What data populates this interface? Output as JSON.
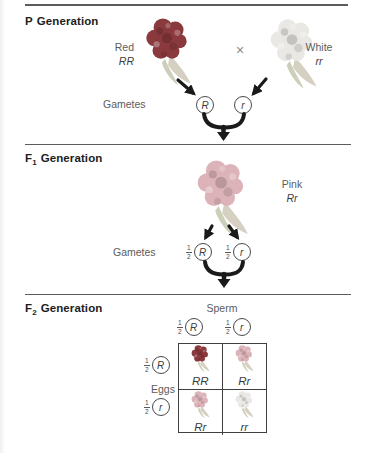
{
  "colors": {
    "red_flower": "#8a393c",
    "pink_flower": "#dcb3b9",
    "white_flower": "#eae8e4",
    "leaf": "#d6d0c2",
    "leaf2": "#cdcfba",
    "line": "#5c5c5c",
    "heading_text": "#1d1d1b",
    "label_text": "#5c5c5c",
    "genotype_text": "#3c3c3c",
    "arrow": "#1a1a1a",
    "circle_stroke": "#4a4a4a",
    "punnett_border": "#3f3f3f"
  },
  "p_generation": {
    "heading_letter": "P",
    "heading_sub": "",
    "heading_word": "Generation",
    "parent1": {
      "label": "Red",
      "genotype": "RR",
      "phenotype": "red"
    },
    "cross_symbol": "×",
    "parent2": {
      "label": "White",
      "genotype": "rr",
      "phenotype": "white"
    },
    "gametes_label": "Gametes",
    "gametes": [
      "R",
      "r"
    ]
  },
  "f1_generation": {
    "heading_letter": "F",
    "heading_sub": "1",
    "heading_word": "Generation",
    "offspring": {
      "label": "Pink",
      "genotype": "Rr",
      "phenotype": "pink"
    },
    "gametes_label": "Gametes",
    "gametes": [
      {
        "fraction_num": "1",
        "fraction_den": "2",
        "allele": "R"
      },
      {
        "fraction_num": "1",
        "fraction_den": "2",
        "allele": "r"
      }
    ]
  },
  "f2_generation": {
    "heading_letter": "F",
    "heading_sub": "2",
    "heading_word": "Generation",
    "sperm_label": "Sperm",
    "eggs_label": "Eggs",
    "sperm_gametes": [
      {
        "fraction_num": "1",
        "fraction_den": "2",
        "allele": "R"
      },
      {
        "fraction_num": "1",
        "fraction_den": "2",
        "allele": "r"
      }
    ],
    "egg_gametes": [
      {
        "fraction_num": "1",
        "fraction_den": "2",
        "allele": "R"
      },
      {
        "fraction_num": "1",
        "fraction_den": "2",
        "allele": "r"
      }
    ],
    "punnett_cells": [
      {
        "genotype": "RR",
        "phenotype": "red"
      },
      {
        "genotype": "Rr",
        "phenotype": "pink"
      },
      {
        "genotype": "Rr",
        "phenotype": "pink"
      },
      {
        "genotype": "rr",
        "phenotype": "white"
      }
    ]
  }
}
